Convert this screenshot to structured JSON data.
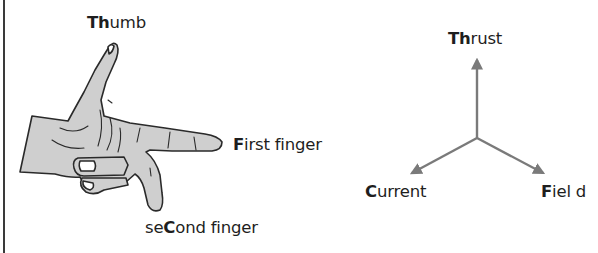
{
  "diagram": {
    "hand_labels": {
      "thumb": {
        "bold": "Th",
        "rest": "umb"
      },
      "first_finger": {
        "bold": "F",
        "rest": "irst finger"
      },
      "second_finger": {
        "pre": "se",
        "bold": "C",
        "rest": "ond finger"
      }
    },
    "axes_labels": {
      "thrust": {
        "bold": "Th",
        "rest": "rust"
      },
      "current": {
        "bold": "C",
        "rest": "urrent"
      },
      "field": {
        "bold": "F",
        "rest": "iel d"
      }
    },
    "colors": {
      "hand_fill": "#cfcfcf",
      "hand_outline": "#2a2a2a",
      "arrow": "#7a7a7a",
      "text": "#1e1e1e"
    }
  }
}
